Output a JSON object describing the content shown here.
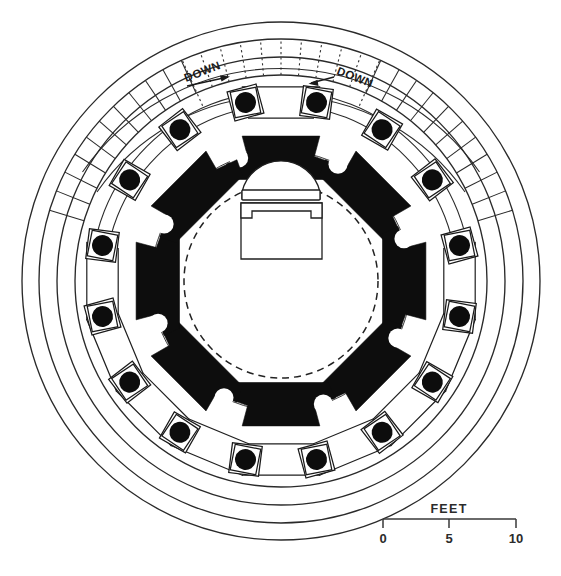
{
  "drawing": {
    "title": "Circular peristyle building floor plan",
    "kind": "architectural-floor-plan",
    "background_color": "#ffffff",
    "ink_color": "#1a1a1a",
    "pier_fill_color": "#0d0d0d"
  },
  "annotations": {
    "stair_left": {
      "label": "DOWN",
      "arrow_direction": "right"
    },
    "stair_right": {
      "label": "DOWN",
      "arrow_direction": "left"
    }
  },
  "scale_bar": {
    "caption": "FEET",
    "ticks": [
      "0",
      "5",
      "10"
    ],
    "units": "feet",
    "min": 0,
    "max": 10
  },
  "plan_geometry": {
    "center_x": 281,
    "center_y": 281,
    "outer_rings_radii": [
      259,
      242,
      224,
      206
    ],
    "colonnade_ring_radii": [
      188,
      176
    ],
    "inner_wall_radii": [
      128,
      121,
      113
    ],
    "dashed_room_radius": 96,
    "outer_column_count": 16,
    "inner_pier_count": 8,
    "outer_column_radius": 182,
    "inner_pier_radius": 140
  }
}
